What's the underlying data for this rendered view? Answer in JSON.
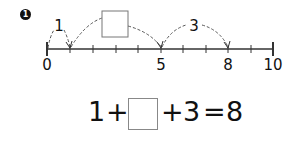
{
  "problem": {
    "number": "1",
    "number_line": {
      "min": 0,
      "max": 10,
      "labels": [
        "0",
        "5",
        "8",
        "10"
      ],
      "label_values": [
        0,
        5,
        8,
        10
      ],
      "jumps": [
        {
          "from": 0,
          "to": 1,
          "label": "1"
        },
        {
          "from": 1,
          "to": 5,
          "label": "",
          "blank_box": true
        },
        {
          "from": 5,
          "to": 8,
          "label": "3"
        }
      ]
    },
    "equation": {
      "term1": "1",
      "op1": "+",
      "blank": "",
      "op2": "+",
      "term3": "3",
      "eq": "=",
      "result": "8"
    }
  },
  "colors": {
    "ink": "#111111",
    "dashed": "#555555",
    "box_border": "#888888"
  }
}
